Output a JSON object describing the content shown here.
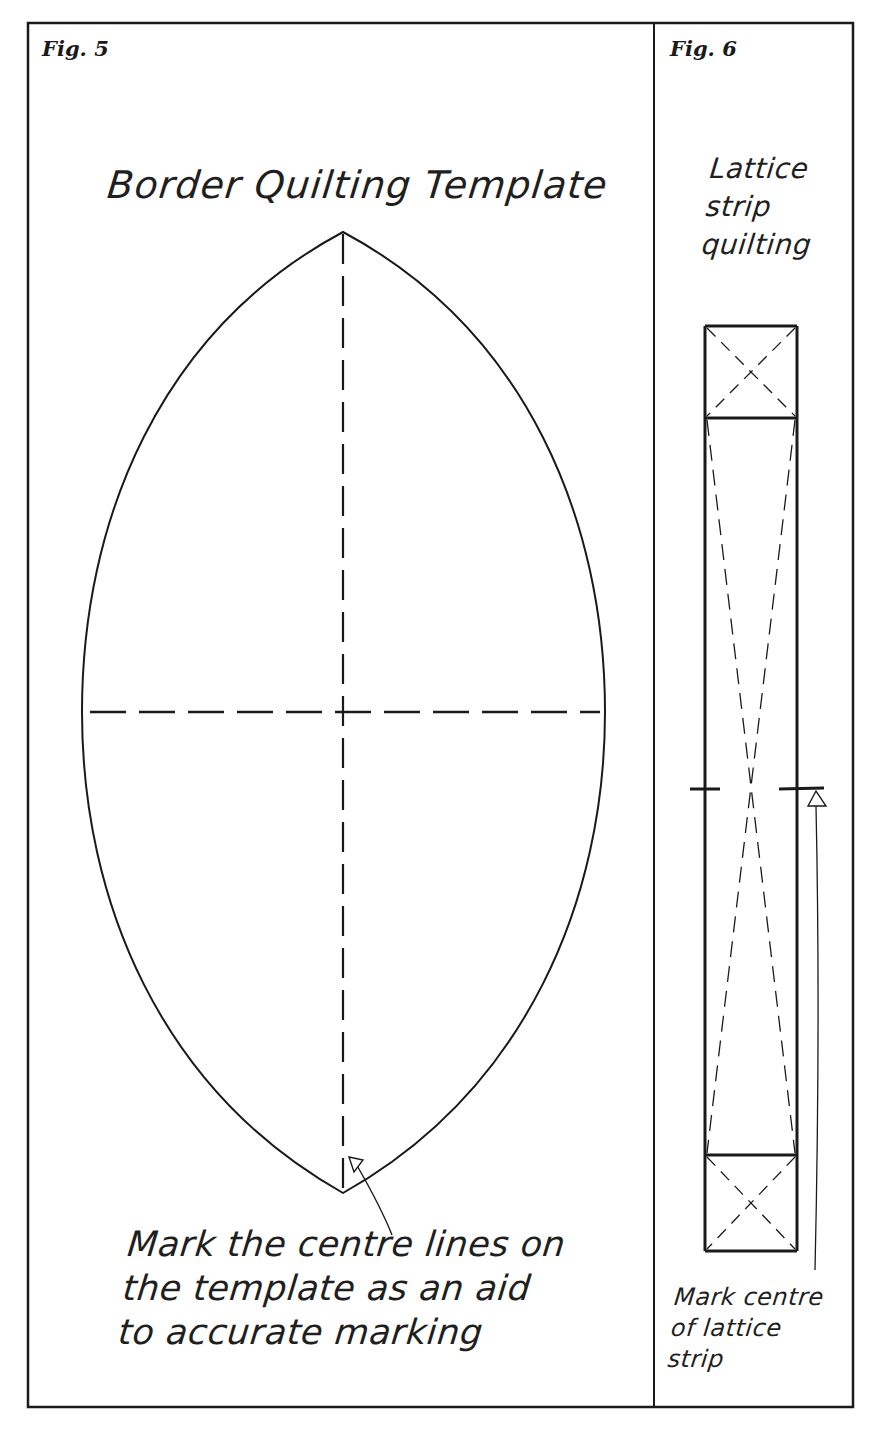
{
  "figures": [
    {
      "id": "fig5",
      "label": "Fig. 5",
      "title": "Border Quilting Template",
      "shape": "pointed oval (leaf / vesica) template with dashed vertical and horizontal centre lines",
      "annotation": {
        "lines": [
          "Mark the centre lines on",
          "the template as an aid",
          "to accurate marking"
        ],
        "pointer": "open-arrowhead-pointing-to-vertical-centre-line"
      }
    },
    {
      "id": "fig6",
      "label": "Fig. 6",
      "title_lines": [
        "Lattice",
        "strip",
        "quilting"
      ],
      "shape": "long vertical lattice strip with a square at each end, each square crossed by dashed diagonals, and long dashed diagonals across the central section",
      "centre_marks": "short horizontal ticks across both long edges at the strip midpoint",
      "annotation": {
        "lines": [
          "Mark centre",
          "of lattice",
          "strip"
        ],
        "pointer": "vertical-arrow-up-to-centre-mark"
      }
    }
  ],
  "colors": {
    "ink": "#1a1a1a",
    "paper": "#ffffff"
  }
}
